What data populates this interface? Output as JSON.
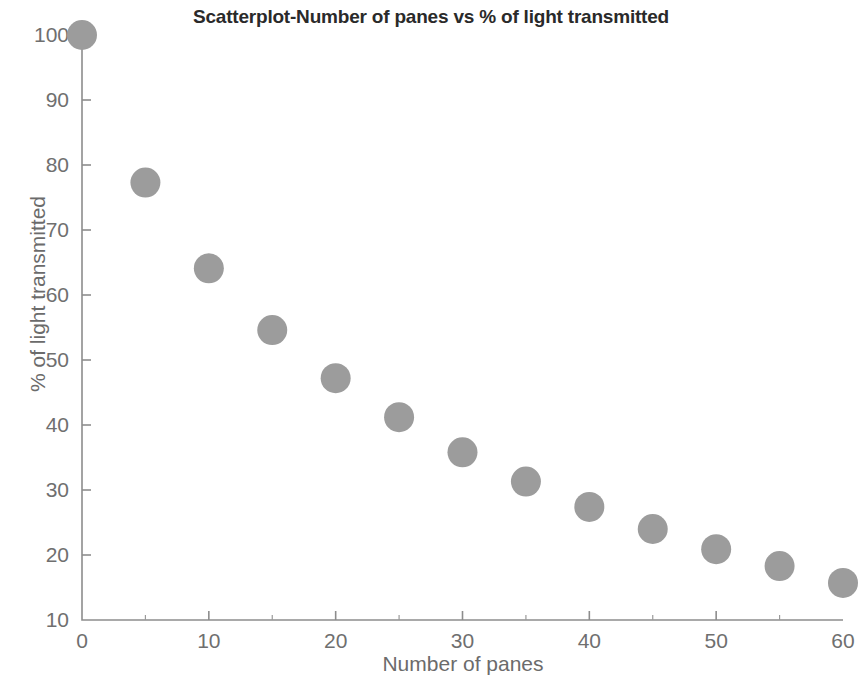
{
  "chart_data": {
    "type": "scatter",
    "title": "Scatterplot-Number of panes vs % of light transmitted",
    "xlabel": "Number of panes",
    "ylabel": "% of light transmitted",
    "xlim": [
      0,
      60
    ],
    "ylim": [
      10,
      100
    ],
    "xticks": [
      0,
      10,
      20,
      30,
      40,
      50,
      60
    ],
    "yticks": [
      10,
      20,
      30,
      40,
      50,
      60,
      70,
      80,
      90,
      100
    ],
    "xtick_labels": [
      "0",
      "10",
      "20",
      "30",
      "40",
      "50",
      "60"
    ],
    "ytick_labels": [
      "10",
      "20",
      "30",
      "40",
      "50",
      "60",
      "70",
      "80",
      "90",
      "100"
    ],
    "x_minor_tick_step": 5,
    "grid": false,
    "legend": null,
    "marker": {
      "shape": "circle",
      "color": "#9c9c9c",
      "size_px": 30
    },
    "x": [
      0,
      5,
      10,
      15,
      20,
      25,
      30,
      35,
      40,
      45,
      50,
      55,
      60
    ],
    "values": [
      100,
      77.3,
      64.1,
      54.6,
      47.2,
      41.2,
      35.8,
      31.3,
      27.4,
      24.0,
      20.9,
      18.3,
      15.7
    ],
    "series": [
      {
        "name": "% of light transmitted",
        "points": [
          {
            "x": 0,
            "y": 100
          },
          {
            "x": 5,
            "y": 77.3
          },
          {
            "x": 10,
            "y": 64.1
          },
          {
            "x": 15,
            "y": 54.6
          },
          {
            "x": 20,
            "y": 47.2
          },
          {
            "x": 25,
            "y": 41.2
          },
          {
            "x": 30,
            "y": 35.8
          },
          {
            "x": 35,
            "y": 31.3
          },
          {
            "x": 40,
            "y": 27.4
          },
          {
            "x": 45,
            "y": 24.0
          },
          {
            "x": 50,
            "y": 20.9
          },
          {
            "x": 55,
            "y": 18.3
          },
          {
            "x": 60,
            "y": 15.7
          }
        ]
      }
    ]
  },
  "colors": {
    "marker": "#9c9c9c",
    "axis": "#8d8d8d",
    "tick_label": "#6f6f6f",
    "axis_label": "#6b6b6b",
    "title": "#2a2a2a",
    "background": "#ffffff"
  }
}
